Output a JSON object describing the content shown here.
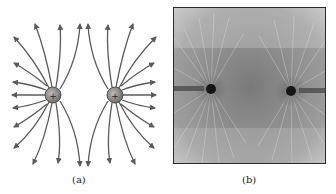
{
  "figure": {
    "panel_a": {
      "label": "(a)",
      "description": "Electric field lines of two equal positive point charges",
      "charges": [
        {
          "sign": "+",
          "x": 53,
          "y": 95,
          "r": 8
        },
        {
          "sign": "+",
          "x": 115,
          "y": 95,
          "r": 8
        }
      ],
      "colors": {
        "line": "#5a5a5a",
        "charge_fill": "#8c8c8c",
        "charge_edge": "#3a3a3a"
      }
    },
    "panel_b": {
      "label": "(b)",
      "description": "Photograph of grass seeds in oil aligned around two like charges",
      "charges": [
        {
          "x": 37,
          "y": 81
        },
        {
          "x": 117,
          "y": 83
        }
      ],
      "colors": {
        "background": "#9a9a9a",
        "dark": "#1a1a1a",
        "light": "#e0e0e0"
      }
    }
  }
}
